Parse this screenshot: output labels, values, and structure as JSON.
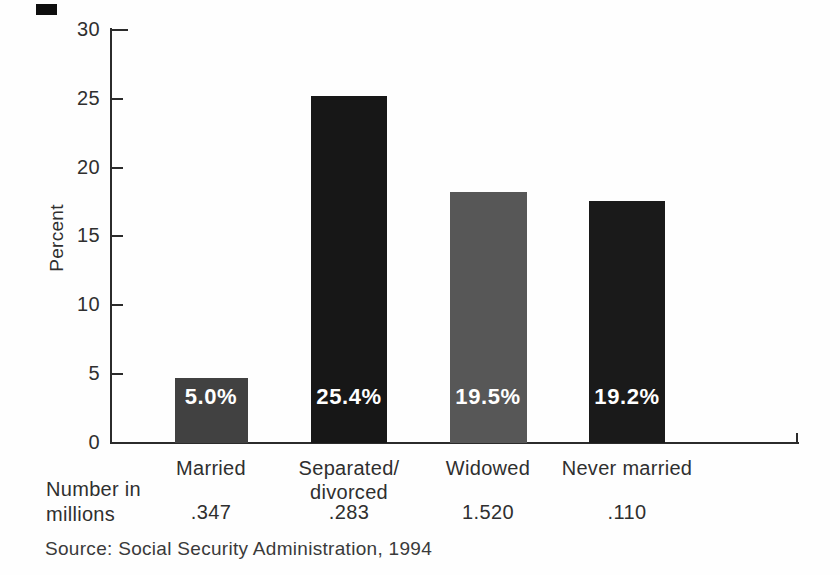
{
  "page": {
    "background": "#fefefe"
  },
  "chart_data": {
    "type": "bar",
    "title": "",
    "ylabel": "Percent",
    "xlabel": "",
    "ylim": [
      0,
      30
    ],
    "yticks": [
      0,
      5,
      10,
      15,
      20,
      25,
      30
    ],
    "grid": false,
    "legend": null,
    "categories": [
      "Married",
      "Separated/divorced",
      "Widowed",
      "Never married"
    ],
    "category_lines": [
      [
        "Married"
      ],
      [
        "Separated/",
        "divorced"
      ],
      [
        "Widowed"
      ],
      [
        "Never married"
      ]
    ],
    "values": [
      5.0,
      25.4,
      19.5,
      19.2
    ],
    "bar_value_labels": [
      "5.0%",
      "25.4%",
      "19.5%",
      "19.2%"
    ],
    "numbers_in_millions": [
      ".347",
      ".283",
      "1.520",
      ".110"
    ],
    "row_label": "Number in millions",
    "row_label_lines": [
      "Number in",
      "millions"
    ],
    "source": "Source: Social Security Administration, 1994",
    "bar_colors": [
      "#414141",
      "#171717",
      "#575757",
      "#1a1a1a"
    ],
    "bar_label_color": "#ffffff",
    "axis_color": "#2b2b2b",
    "text_color": "#2f2f2f",
    "drawn_heights_percent": [
      4.7,
      25.2,
      18.2,
      17.6
    ],
    "layout": {
      "bar_centers_px": [
        211,
        349,
        488,
        627
      ],
      "bar_widths_px": [
        73,
        76,
        77,
        76
      ],
      "baseline_y": 443,
      "axis_x": 110,
      "axis_top_y": 28,
      "axis_right_x": 799,
      "px_per_percent": 13.767,
      "value_label_top_y": 384,
      "category_top_y": 456,
      "millions_row_top_y": 501
    }
  }
}
